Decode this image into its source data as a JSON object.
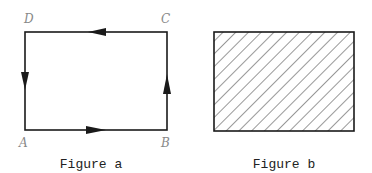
{
  "figure_a": {
    "caption": "Figure a",
    "vertices": {
      "A": "A",
      "B": "B",
      "C": "C",
      "D": "D"
    },
    "direction": "A → B → C → D → A (counterclockwise arrows)"
  },
  "figure_b": {
    "caption": "Figure b",
    "fill": "diagonal hatching"
  },
  "colors": {
    "stroke": "#1a1a1a",
    "label": "#888888"
  }
}
